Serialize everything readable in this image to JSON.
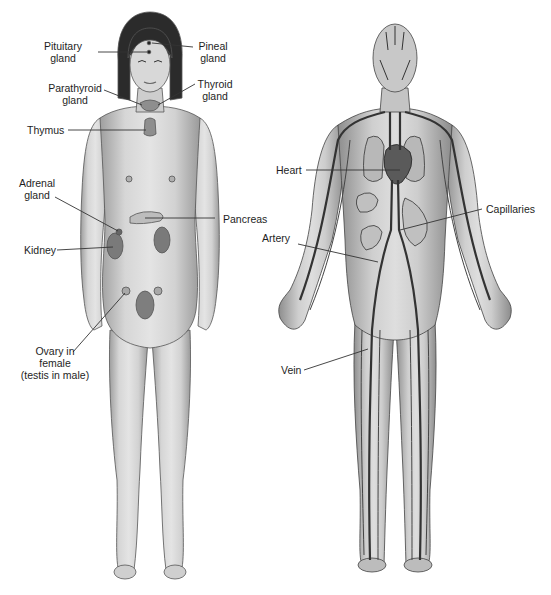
{
  "figures": [
    {
      "id": "endocrine",
      "subject": "female figure showing endocrine glands",
      "labels": {
        "pituitary": [
          "Pituitary",
          "gland"
        ],
        "pineal": [
          "Pineal",
          "gland"
        ],
        "parathyroid": [
          "Parathyroid",
          "gland"
        ],
        "thyroid": [
          "Thyroid",
          "gland"
        ],
        "thymus": [
          "Thymus"
        ],
        "adrenal": [
          "Adrenal",
          "gland"
        ],
        "pancreas": [
          "Pancreas"
        ],
        "kidney": [
          "Kidney"
        ],
        "ovary": [
          "Ovary in",
          "female",
          "(testis in male)"
        ]
      }
    },
    {
      "id": "circulatory",
      "subject": "male figure showing circulatory system",
      "labels": {
        "heart": [
          "Heart"
        ],
        "capillaries": [
          "Capillaries"
        ],
        "artery": [
          "Artery"
        ],
        "vein": [
          "Vein"
        ]
      }
    }
  ],
  "colors": {
    "skin": "#d4d4d4",
    "skin_shade": "#a8a8a8",
    "hair": "#2a2a2a",
    "organ": "#8a8a8a",
    "vessel": "#3a3a3a",
    "leader_line": "#333333"
  }
}
